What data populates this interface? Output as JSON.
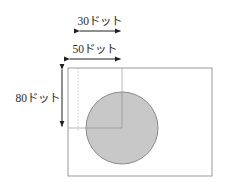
{
  "diagram": {
    "title": "",
    "unit_suffix": "ドット",
    "labels": {
      "width_inner": "30ドット",
      "width_outer": "50ドット",
      "height": "80ドット"
    },
    "colors": {
      "circle_fill": "#c8c8c8",
      "circle_stroke": "#8a8a8a",
      "rect_stroke": "#9a9a9a",
      "guide_line": "#b9b9b9",
      "arrow": "#1f1f1f",
      "text": "#2b2b2b",
      "background": "#ffffff"
    },
    "shapes": {
      "outer_rect": {
        "x": 68,
        "y": 68,
        "width": 144,
        "height": 108
      },
      "circle": {
        "cx": 122,
        "cy": 128,
        "r": 36
      },
      "guide_vertical_dotted_x": 78,
      "guide_vertical_solid_x": 122,
      "guide_horizontal_y": 128
    },
    "dimensions": [
      {
        "name": "30ドット",
        "value": 30,
        "orientation": "horizontal",
        "from": 78,
        "to": 122,
        "axis_pos": 29
      },
      {
        "name": "50ドット",
        "value": 50,
        "orientation": "horizontal",
        "from": 68,
        "to": 122,
        "axis_pos": 57
      },
      {
        "name": "80ドット",
        "value": 80,
        "orientation": "vertical",
        "from": 68,
        "to": 128,
        "axis_pos": 62
      }
    ]
  }
}
